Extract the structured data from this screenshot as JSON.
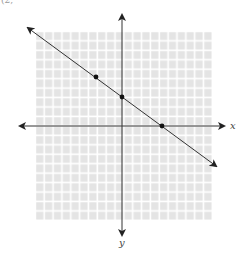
{
  "fragment_text": "(2, ",
  "axes": {
    "x_label": "x",
    "y_label": "y",
    "origin_px": [
      122,
      126
    ],
    "cell_px": 8.85,
    "x_range_cells": [
      -10,
      10
    ],
    "y_range_cells": [
      -10,
      10
    ]
  },
  "grid": {
    "left": 35,
    "top": 31,
    "right": 212,
    "bottom": 220,
    "cells_x": 20,
    "cells_y": 20,
    "fill_color": "#e6e6e6",
    "line_color": "#ffffff"
  },
  "line": {
    "from_px": [
      28,
      57
    ],
    "to_px": [
      216,
      197
    ],
    "color": "#333333",
    "description": "line with negative slope, arrows both ends"
  },
  "points": [
    {
      "label": "point-a",
      "px": [
        96,
        77
      ]
    },
    {
      "label": "y-intercept",
      "px": [
        122,
        97
      ]
    },
    {
      "label": "x-intercept",
      "px": [
        162,
        125
      ]
    }
  ]
}
